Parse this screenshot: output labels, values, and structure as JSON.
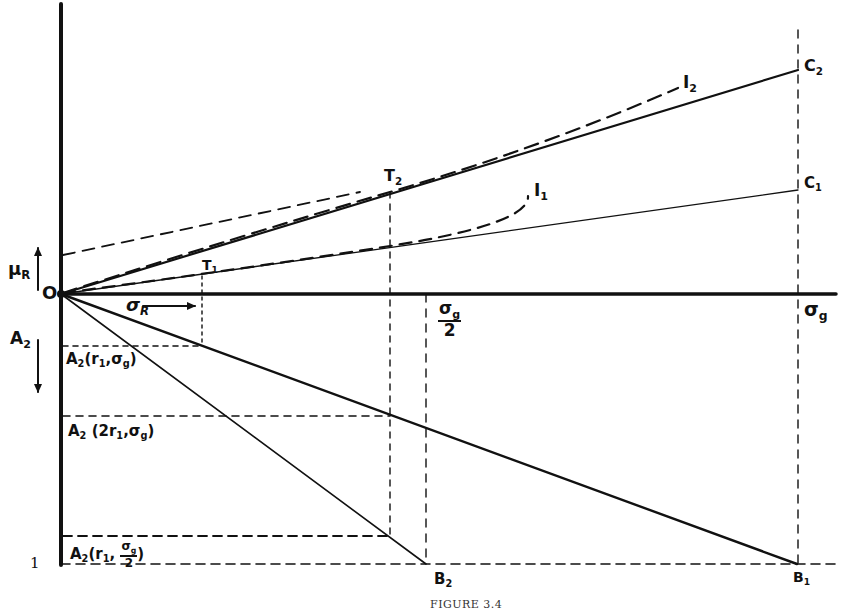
{
  "figure": {
    "caption": "FIGURE 3.4",
    "origin_label": "O",
    "unit_label": "1",
    "axes": {
      "vertical_up_label": "μ",
      "vertical_up_sub": "R",
      "vertical_down_label": "A",
      "vertical_down_sub": "2",
      "horizontal_arrow_label": "σ",
      "horizontal_arrow_sub": "R",
      "sigma_g_label": "σ",
      "sigma_g_sub": "g",
      "sigma_g_half_num": "σ",
      "sigma_g_half_num_sub": "g",
      "sigma_g_half_den": "2"
    },
    "points": {
      "T1": {
        "label": "T",
        "sub": "1"
      },
      "T2": {
        "label": "T",
        "sub": "2"
      },
      "C1": {
        "label": "C",
        "sub": "1"
      },
      "C2": {
        "label": "C",
        "sub": "2"
      },
      "B1": {
        "label": "B",
        "sub": "1"
      },
      "B2": {
        "label": "B",
        "sub": "2"
      },
      "I1": {
        "label": "I",
        "sub": "1"
      },
      "I2": {
        "label": "I",
        "sub": "2"
      }
    },
    "annotations": {
      "a2_r1_sg": {
        "prefix": "A",
        "prefix_sub": "2",
        "args": "(r",
        "arg1_sub": "1",
        "sep": ",σ",
        "arg2_sub": "g",
        "close": ")"
      },
      "a2_2r1_sg": {
        "prefix": "A",
        "prefix_sub": "2",
        "args": " (2r",
        "arg1_sub": "1",
        "sep": ",σ",
        "arg2_sub": "g",
        "close": ")"
      },
      "a2_r1_sg_half": {
        "prefix": "A",
        "prefix_sub": "2",
        "args": "(r",
        "arg1_sub": "1",
        "sep": ", ",
        "frac_num": "σ",
        "frac_num_sub": "g",
        "frac_den": "2",
        "close": ")"
      }
    },
    "colors": {
      "ink": "#111111",
      "paper": "#ffffff"
    }
  }
}
